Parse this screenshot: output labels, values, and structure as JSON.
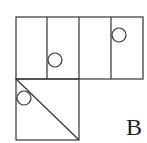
{
  "diagram": {
    "type": "cube-net-option",
    "label": "B",
    "colors": {
      "stroke": "#333333",
      "background": "#ffffff",
      "text": "#222222"
    },
    "faces": [
      {
        "id": "top-1",
        "shape": "rectangle",
        "mark": "none"
      },
      {
        "id": "top-2",
        "shape": "rectangle",
        "mark": "circle-lower"
      },
      {
        "id": "top-3",
        "shape": "rectangle",
        "mark": "none"
      },
      {
        "id": "top-4",
        "shape": "rectangle",
        "mark": "circle-upper"
      },
      {
        "id": "bottom-square",
        "shape": "square",
        "mark": "diagonal-with-circle"
      }
    ]
  }
}
